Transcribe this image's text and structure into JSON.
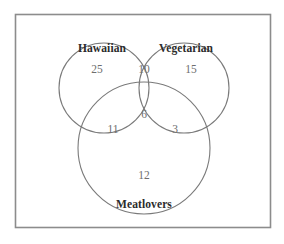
{
  "figure": {
    "type": "venn-diagram",
    "set_count": 3,
    "universe_box": {
      "visible": true,
      "stroke": "#8c8c8c"
    },
    "circle_stroke": "#7a7a7a",
    "label_color": "#2b2b2b",
    "count_color": "#6e6e6e",
    "background": "#ffffff"
  },
  "sets": [
    {
      "id": "hawaiian",
      "label": "Hawaiian",
      "cx": 104,
      "cy": 88,
      "r": 45
    },
    {
      "id": "vegetarian",
      "label": "Vegetarian",
      "cx": 184,
      "cy": 88,
      "r": 45
    },
    {
      "id": "meatlovers",
      "label": "Meatlovers",
      "cx": 144,
      "cy": 148,
      "r": 66
    }
  ],
  "set_label_positions": [
    {
      "x": 102,
      "y": 52
    },
    {
      "x": 186,
      "y": 52
    },
    {
      "x": 144,
      "y": 208
    }
  ],
  "regions": [
    {
      "id": "hawaiian-only",
      "value": "25",
      "x": 97,
      "y": 73
    },
    {
      "id": "hawaiian-vegetarian",
      "value": "10",
      "x": 144,
      "y": 73
    },
    {
      "id": "vegetarian-only",
      "value": "15",
      "x": 191,
      "y": 73
    },
    {
      "id": "hawaiian-meatlovers",
      "value": "11",
      "x": 113,
      "y": 133
    },
    {
      "id": "all-three",
      "value": "6",
      "x": 144,
      "y": 118
    },
    {
      "id": "vegetarian-meatlovers",
      "value": "3",
      "x": 175,
      "y": 133
    },
    {
      "id": "meatlovers-only",
      "value": "12",
      "x": 144,
      "y": 179
    }
  ],
  "chart_data": {
    "type": "venn",
    "title": "",
    "sets": [
      "Hawaiian",
      "Vegetarian",
      "Meatlovers"
    ],
    "region_values": {
      "Hawaiian only": 25,
      "Hawaiian and Vegetarian only": 10,
      "Vegetarian only": 15,
      "Hawaiian and Meatlovers only": 11,
      "Hawaiian and Vegetarian and Meatlovers": 6,
      "Vegetarian and Meatlovers only": 3,
      "Meatlovers only": 12
    },
    "set_totals": {
      "Hawaiian": 52,
      "Vegetarian": 34,
      "Meatlovers": 32
    },
    "total_inside_sets": 82,
    "outside_universe": null,
    "legend": "none",
    "grid": false
  }
}
